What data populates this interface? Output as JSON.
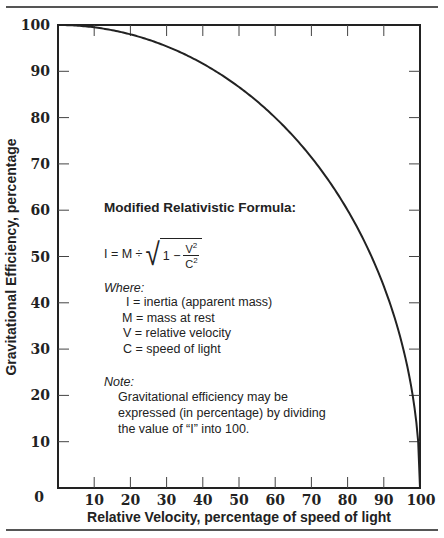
{
  "chart_data": {
    "type": "line",
    "title": "",
    "xlabel": "Relative Velocity, percentage of speed of light",
    "ylabel": "Gravitational Efficiency, percentage",
    "xlim": [
      0,
      100
    ],
    "ylim": [
      0,
      100
    ],
    "x_ticks": [
      "10",
      "20",
      "30",
      "40",
      "50",
      "60",
      "70",
      "80",
      "90",
      "100"
    ],
    "y_ticks": [
      "100",
      "90",
      "80",
      "70",
      "60",
      "50",
      "40",
      "30",
      "20",
      "10",
      "0"
    ],
    "grid": false,
    "legend": null,
    "series": [
      {
        "name": "Gravitational Efficiency",
        "x": [
          0,
          10,
          20,
          30,
          40,
          50,
          60,
          70,
          80,
          90,
          95,
          99,
          100
        ],
        "y": [
          100,
          99.5,
          98.0,
          95.4,
          91.7,
          86.6,
          80.0,
          71.4,
          60.0,
          43.6,
          31.2,
          14.1,
          0
        ]
      }
    ]
  },
  "annotation": {
    "title": "Modified Relativistic Formula:",
    "formula": {
      "lhs": "I = M ÷",
      "one": "1 −",
      "numerator": "V",
      "denominator": "C",
      "exp": "2"
    },
    "where_label": "Where:",
    "definitions": [
      "I = inertia (apparent mass)",
      "M = mass at rest",
      "V = relative velocity",
      "C = speed of light"
    ],
    "note_label": "Note:",
    "note_lines": [
      "Gravitational efficiency may be",
      "expressed (in percentage) by dividing",
      "the value of “I” into 100."
    ]
  }
}
